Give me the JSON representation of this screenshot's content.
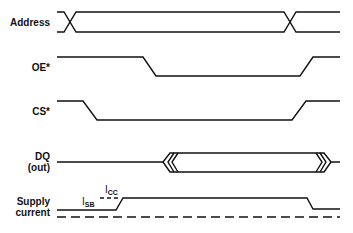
{
  "diagram": {
    "type": "timing-diagram",
    "signals": [
      {
        "id": "address",
        "label": "Address"
      },
      {
        "id": "oe",
        "label": "OE*"
      },
      {
        "id": "cs",
        "label": "CS*"
      },
      {
        "id": "dq",
        "label_line1": "DQ",
        "label_line2": "(out)"
      },
      {
        "id": "supply",
        "label_line1": "Supply",
        "label_line2": "current"
      }
    ],
    "annotations": {
      "isb": {
        "main": "I",
        "sub": "SB"
      },
      "icc": {
        "main": "I",
        "sub": "CC"
      }
    }
  }
}
